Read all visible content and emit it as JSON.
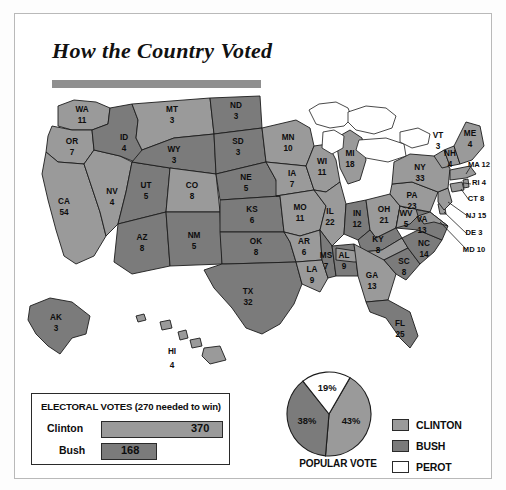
{
  "title": "How the Country Voted",
  "colors": {
    "clinton": "#9a9a9a",
    "bush": "#7b7b7b",
    "perot": "#ffffff",
    "outline": "#1c1c1c",
    "rule": "#8f8f8f"
  },
  "electoral_box": {
    "heading": "ELECTORAL VOTES (270 needed to win)",
    "rows": [
      {
        "name": "Clinton",
        "value": "370",
        "winner": "clinton"
      },
      {
        "name": "Bush",
        "value": "168",
        "winner": "bush"
      }
    ]
  },
  "popular_vote": {
    "caption": "POPULAR VOTE",
    "slices": [
      {
        "label": "43%",
        "winner": "clinton"
      },
      {
        "label": "38%",
        "winner": "bush"
      },
      {
        "label": "19%",
        "winner": "perot"
      }
    ]
  },
  "legend": [
    {
      "label": "CLINTON",
      "key": "clinton"
    },
    {
      "label": "BUSH",
      "key": "bush"
    },
    {
      "label": "PEROT",
      "key": "perot"
    }
  ],
  "chart_data": {
    "type": "map",
    "title": "How the Country Voted",
    "subtitle": "1992 United States presidential election results by state",
    "legend_entries": [
      "CLINTON",
      "BUSH",
      "PEROT"
    ],
    "electoral_total_needed": 270,
    "electoral_votes": {
      "Clinton": 370,
      "Bush": 168,
      "Perot": 0
    },
    "popular_vote_pct": {
      "Clinton": 43,
      "Bush": 38,
      "Perot": 19
    },
    "states": [
      {
        "code": "WA",
        "votes": 11,
        "winner": "clinton"
      },
      {
        "code": "OR",
        "votes": 7,
        "winner": "clinton"
      },
      {
        "code": "CA",
        "votes": 54,
        "winner": "clinton"
      },
      {
        "code": "NV",
        "votes": 4,
        "winner": "clinton"
      },
      {
        "code": "ID",
        "votes": 4,
        "winner": "bush"
      },
      {
        "code": "MT",
        "votes": 3,
        "winner": "clinton"
      },
      {
        "code": "WY",
        "votes": 3,
        "winner": "bush"
      },
      {
        "code": "UT",
        "votes": 5,
        "winner": "bush"
      },
      {
        "code": "AZ",
        "votes": 8,
        "winner": "bush"
      },
      {
        "code": "CO",
        "votes": 8,
        "winner": "clinton"
      },
      {
        "code": "NM",
        "votes": 5,
        "winner": "bush"
      },
      {
        "code": "ND",
        "votes": 3,
        "winner": "bush"
      },
      {
        "code": "SD",
        "votes": 3,
        "winner": "bush"
      },
      {
        "code": "NE",
        "votes": 5,
        "winner": "bush"
      },
      {
        "code": "KS",
        "votes": 6,
        "winner": "bush"
      },
      {
        "code": "OK",
        "votes": 8,
        "winner": "bush"
      },
      {
        "code": "TX",
        "votes": 32,
        "winner": "bush"
      },
      {
        "code": "MN",
        "votes": 10,
        "winner": "clinton"
      },
      {
        "code": "IA",
        "votes": 7,
        "winner": "clinton"
      },
      {
        "code": "MO",
        "votes": 11,
        "winner": "clinton"
      },
      {
        "code": "AR",
        "votes": 6,
        "winner": "clinton"
      },
      {
        "code": "LA",
        "votes": 9,
        "winner": "clinton"
      },
      {
        "code": "WI",
        "votes": 11,
        "winner": "clinton"
      },
      {
        "code": "IL",
        "votes": 22,
        "winner": "clinton"
      },
      {
        "code": "MS",
        "votes": 7,
        "winner": "bush"
      },
      {
        "code": "MI",
        "votes": 18,
        "winner": "clinton"
      },
      {
        "code": "IN",
        "votes": 12,
        "winner": "bush"
      },
      {
        "code": "OH",
        "votes": 21,
        "winner": "clinton"
      },
      {
        "code": "KY",
        "votes": 8,
        "winner": "bush"
      },
      {
        "code": "TN",
        "votes": 11,
        "winner": "clinton"
      },
      {
        "code": "AL",
        "votes": 9,
        "winner": "bush"
      },
      {
        "code": "GA",
        "votes": 13,
        "winner": "clinton"
      },
      {
        "code": "FL",
        "votes": 25,
        "winner": "bush"
      },
      {
        "code": "SC",
        "votes": 8,
        "winner": "bush"
      },
      {
        "code": "NC",
        "votes": 14,
        "winner": "bush"
      },
      {
        "code": "VA",
        "votes": 13,
        "winner": "bush"
      },
      {
        "code": "WV",
        "votes": 5,
        "winner": "clinton"
      },
      {
        "code": "PA",
        "votes": 23,
        "winner": "clinton"
      },
      {
        "code": "MD",
        "votes": 10,
        "winner": "clinton"
      },
      {
        "code": "DE",
        "votes": 3,
        "winner": "clinton"
      },
      {
        "code": "NJ",
        "votes": 15,
        "winner": "clinton"
      },
      {
        "code": "NY",
        "votes": 33,
        "winner": "clinton"
      },
      {
        "code": "CT",
        "votes": 8,
        "winner": "clinton"
      },
      {
        "code": "RI",
        "votes": 4,
        "winner": "clinton"
      },
      {
        "code": "MA",
        "votes": 12,
        "winner": "clinton"
      },
      {
        "code": "VT",
        "votes": 3,
        "winner": "clinton"
      },
      {
        "code": "NH",
        "votes": 4,
        "winner": "clinton"
      },
      {
        "code": "ME",
        "votes": 4,
        "winner": "clinton"
      },
      {
        "code": "AK",
        "votes": 3,
        "winner": "bush"
      },
      {
        "code": "HI",
        "votes": 4,
        "winner": "clinton"
      }
    ]
  }
}
